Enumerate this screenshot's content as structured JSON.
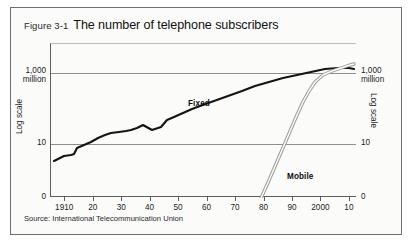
{
  "figure": {
    "number": "Figure 3-1",
    "title": "The number of telephone subscribers",
    "source": "Source: International Telecommunication Union"
  },
  "axes": {
    "left_title": "Log scale",
    "right_title": "Log scale",
    "y_labels": {
      "top_line1": "1,000",
      "top_line2": "million",
      "mid": "10",
      "zero": "0"
    }
  },
  "series_labels": {
    "fixed": "Fixed",
    "mobile": "Mobile"
  },
  "chart_data": {
    "type": "line",
    "title": "The number of telephone subscribers",
    "subtitle": "Figure 3-1",
    "xlabel": "",
    "ylabel": "Log scale",
    "y_scale": "log",
    "grid": true,
    "legend_position": "inline-annotations",
    "xlim": [
      1905,
      2012
    ],
    "ylim_labels": [
      "0",
      "10",
      "1,000 million"
    ],
    "xticks": [
      1910,
      1920,
      1930,
      1940,
      1950,
      1960,
      1970,
      1980,
      1990,
      2000,
      2010
    ],
    "xtick_labels": [
      "1910",
      "20",
      "30",
      "40",
      "50",
      "60",
      "70",
      "80",
      "90",
      "2000",
      "10"
    ],
    "ygridlines": [
      10,
      1000
    ],
    "ygridline_labels": [
      "10",
      "1,000 million"
    ],
    "series": [
      {
        "name": "Fixed",
        "style": "solid-thick-black",
        "x": [
          1906,
          1910,
          1913,
          1915,
          1918,
          1920,
          1922,
          1925,
          1928,
          1930,
          1933,
          1936,
          1938,
          1940,
          1942,
          1945,
          1948,
          1950,
          1952,
          1955,
          1958,
          1960,
          1965,
          1970,
          1975,
          1980,
          1985,
          1990,
          1995,
          2000,
          2003,
          2006,
          2009,
          2011
        ],
        "y": [
          6.5,
          9.5,
          10.0,
          10.2,
          11.5,
          13.0,
          16.0,
          19.0,
          22.0,
          24.0,
          24.5,
          25.0,
          26.0,
          28.0,
          31.0,
          27.5,
          30.0,
          38.0,
          48.0,
          62.0,
          82.0,
          100,
          150,
          220,
          330,
          450,
          560,
          680,
          800,
          950,
          1100,
          1220,
          1250,
          1230
        ],
        "units": "million subscribers"
      },
      {
        "name": "Mobile",
        "style": "double-outline",
        "x": [
          1984,
          1986,
          1988,
          1990,
          1992,
          1994,
          1996,
          1998,
          2000,
          2002,
          2003,
          2005,
          2007,
          2009,
          2011
        ],
        "y": [
          0.3,
          0.7,
          2.0,
          5.0,
          13.0,
          35.0,
          90.0,
          230,
          500,
          800,
          1100,
          1900,
          3200,
          4500,
          5800
        ],
        "units": "million subscribers"
      }
    ],
    "annotations": [
      {
        "text": "Fixed",
        "x": 1962,
        "y": 210
      },
      {
        "text": "Mobile",
        "x": 1997,
        "y": 14
      }
    ]
  },
  "xticks": [
    {
      "label": "1910",
      "pos": 0.0465
    },
    {
      "label": "20",
      "pos": 0.1395
    },
    {
      "label": "30",
      "pos": 0.2326
    },
    {
      "label": "40",
      "pos": 0.3256
    },
    {
      "label": "50",
      "pos": 0.4186
    },
    {
      "label": "60",
      "pos": 0.5116
    },
    {
      "label": "70",
      "pos": 0.6047
    },
    {
      "label": "80",
      "pos": 0.6977
    },
    {
      "label": "90",
      "pos": 0.7907
    },
    {
      "label": "2000",
      "pos": 0.8837
    },
    {
      "label": "10",
      "pos": 0.9767
    }
  ]
}
